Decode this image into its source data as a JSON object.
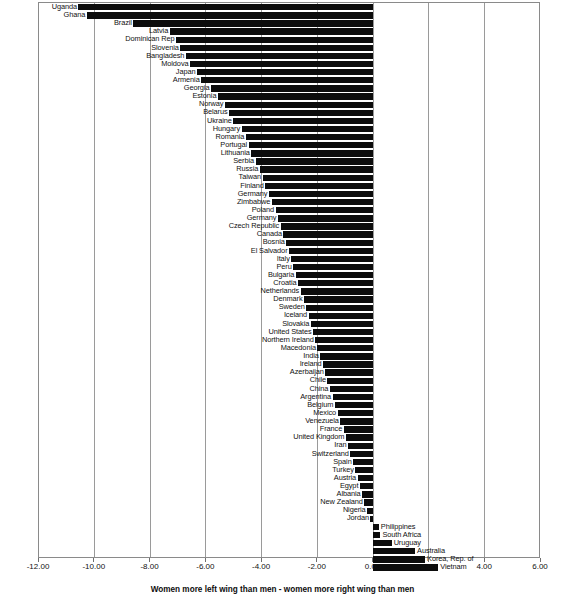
{
  "chart_data": {
    "type": "bar",
    "orientation": "horizontal",
    "title": "",
    "subtitle": "",
    "xlabel": "Women more left wing than men - women more right wing than men",
    "ylabel": "",
    "xlim": [
      -12.0,
      6.0
    ],
    "xticks": [
      "-12.00",
      "-10.00",
      "-8.00",
      "-6.00",
      "-4.00",
      "-2.00",
      "0.00",
      "2.00",
      "4.00",
      "6.00"
    ],
    "xtick_values": [
      -12,
      -10,
      -8,
      -6,
      -4,
      -2,
      0,
      2,
      4,
      6
    ],
    "grid": true,
    "legend": false,
    "bar_color": "#0c0c0c",
    "categories": [
      "Uganda",
      "Ghana",
      "Brazil",
      "Latvia",
      "Dominican Rep",
      "Slovenia",
      "Bangladesh",
      "Moldova",
      "Japan",
      "Armenia",
      "Georgia",
      "Estonia",
      "Norway",
      "Belarus",
      "Ukraine",
      "Hungary",
      "Romania",
      "Portugal",
      "Lithuania",
      "Serbia",
      "Russia",
      "Taiwan",
      "Finland",
      "Germany",
      "Zimbabwe",
      "Poland",
      "Germany",
      "Czech Republic",
      "Canada",
      "Bosnia",
      "El Salvador",
      "Italy",
      "Peru",
      "Bulgaria",
      "Croatia",
      "Netherlands",
      "Denmark",
      "Sweden",
      "Iceland",
      "Slovakia",
      "United States",
      "Northern Ireland",
      "Macedonia",
      "India",
      "Ireland",
      "Azerbaijan",
      "Chile",
      "China",
      "Argentina",
      "Belgium",
      "Mexico",
      "Venezuela",
      "France",
      "United Kingdom",
      "Iran",
      "Switzerland",
      "Spain",
      "Turkey",
      "Austria",
      "Egypt",
      "Albania",
      "New Zealand",
      "Nigeria",
      "Jordan",
      "Philippines",
      "South Africa",
      "Uruguay",
      "Australia",
      "Korea, Rep. of",
      "Vietnam"
    ],
    "values": [
      -10.55,
      -10.25,
      -8.58,
      -7.28,
      -7.05,
      -6.9,
      -6.7,
      -6.55,
      -6.3,
      -6.15,
      -5.8,
      -5.55,
      -5.3,
      -5.15,
      -5.0,
      -4.7,
      -4.55,
      -4.45,
      -4.35,
      -4.2,
      -4.05,
      -3.95,
      -3.85,
      -3.72,
      -3.62,
      -3.48,
      -3.4,
      -3.3,
      -3.2,
      -3.1,
      -3.0,
      -2.92,
      -2.85,
      -2.76,
      -2.68,
      -2.58,
      -2.46,
      -2.38,
      -2.3,
      -2.22,
      -2.14,
      -2.06,
      -1.98,
      -1.88,
      -1.78,
      -1.7,
      -1.62,
      -1.54,
      -1.44,
      -1.36,
      -1.26,
      -1.16,
      -1.04,
      -0.96,
      -0.88,
      -0.8,
      -0.7,
      -0.62,
      -0.54,
      -0.46,
      -0.38,
      -0.3,
      -0.2,
      -0.08,
      0.22,
      0.28,
      0.68,
      1.52,
      1.88,
      2.35
    ]
  }
}
